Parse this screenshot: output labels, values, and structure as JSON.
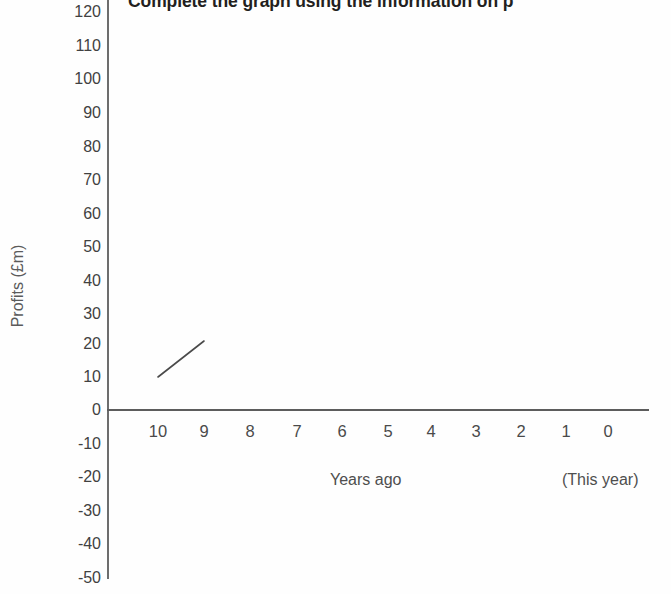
{
  "chart_data": {
    "type": "line",
    "title": "Complete the graph using the information on p",
    "xlabel": "Years ago",
    "ylabel": "Profits (£m)",
    "x_axis_note": "(This year)",
    "categories": [
      10,
      9,
      8,
      7,
      6,
      5,
      4,
      3,
      2,
      1,
      0
    ],
    "xticklabels": [
      "10",
      "9",
      "8",
      "7",
      "6",
      "5",
      "4",
      "3",
      "2",
      "1",
      "0"
    ],
    "yticklabels": [
      "120",
      "110",
      "100",
      "90",
      "80",
      "70",
      "60",
      "50",
      "40",
      "30",
      "20",
      "10",
      "0",
      "-10",
      "-20",
      "-30",
      "-40",
      "-50"
    ],
    "ytickvalues": [
      120,
      110,
      100,
      90,
      80,
      70,
      60,
      50,
      40,
      30,
      20,
      10,
      0,
      -10,
      -20,
      -30,
      -40,
      -50
    ],
    "ylim": [
      -50,
      120
    ],
    "xlim": [
      10,
      0
    ],
    "grid": false,
    "legend": false,
    "series": [
      {
        "name": "Profits",
        "x": [
          10,
          9
        ],
        "values": [
          10,
          21
        ],
        "color": "#4a4a4a",
        "note": "Only the first segment is drawn; the rest of the graph is left blank for the student to complete."
      }
    ]
  },
  "axis_geometry": {
    "y_tick_positions_px": [
      12,
      46,
      79,
      113,
      147,
      180,
      214,
      247,
      281,
      314,
      344,
      377,
      410,
      444,
      477,
      511,
      544,
      578
    ],
    "x_tick_positions_px": [
      158,
      204,
      250,
      297,
      342,
      388,
      431,
      476,
      521,
      566,
      608
    ]
  }
}
